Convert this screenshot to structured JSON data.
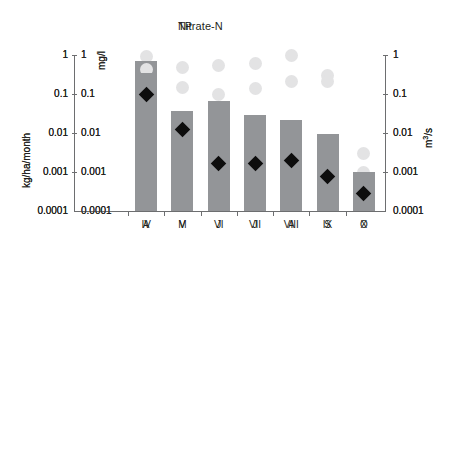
{
  "figure": {
    "background": "#ffffff",
    "bar_color": "#939598",
    "circle_color": "#e3e3e4",
    "diamond_color": "#0d0d0d",
    "axis_color": "#6d6e70",
    "text_color": "#231f20"
  },
  "chart_data": [
    {
      "type": "bar",
      "title": "Nitrate-N",
      "panel_id": "nitrate-n",
      "xlabel": "",
      "ylabel": "kg/ha/month",
      "ylabel_secondary": "mg/l",
      "ylabel_right": "m3/s",
      "ylabel_right_display": "m3/s",
      "categories": [
        "IV",
        "V",
        "VI",
        "VII",
        "VIII",
        "IX",
        "X"
      ],
      "yscale": "log",
      "ylim": [
        0.0001,
        1
      ],
      "ytick_labels": [
        "1",
        "0.1",
        "0.01",
        "0.001",
        "0.0001"
      ],
      "ytick_values": [
        1,
        0.1,
        0.01,
        0.001,
        0.0001
      ],
      "ytick_labels_secondary": [
        "1",
        "0.1",
        "0.01",
        "0.001",
        "0.0001"
      ],
      "ytick_labels_right": [
        "1",
        "0.1",
        "0.01",
        "0.001",
        "0.0001"
      ],
      "grid": false,
      "legend": "none",
      "series": [
        {
          "name": "kg/ha/month",
          "mark": "bar",
          "color": "#939598",
          "values": [
            0.7,
            0.037,
            0.065,
            0.029,
            0.022,
            0.0095,
            0.001
          ]
        },
        {
          "name": "mg/l",
          "mark": "circle",
          "color": "#e3e3e4",
          "values": [
            0.9,
            0.48,
            0.55,
            0.62,
            1.0,
            0.3,
            0.001
          ]
        },
        {
          "name": "m3/s",
          "mark": "diamond",
          "color": "#0d0d0d",
          "values": [
            0.1,
            0.008,
            0.0017,
            0.0017,
            0.002,
            0.00075,
            0.00028
          ]
        }
      ]
    },
    {
      "type": "bar",
      "title": "TP",
      "panel_id": "tp",
      "xlabel": "",
      "ylabel": "kg/ha/month",
      "ylabel_secondary": "mg/l",
      "ylabel_right": "m3/s",
      "ylabel_right_display": "m3/s",
      "categories": [
        "A",
        "M",
        "J",
        "J",
        "A",
        "S",
        "O"
      ],
      "yscale": "log",
      "ylim": [
        0.0001,
        1
      ],
      "ytick_labels": [
        "1",
        "0.1",
        "0.01",
        "0.001",
        "0.0001"
      ],
      "ytick_values": [
        1,
        0.1,
        0.01,
        0.001,
        0.0001
      ],
      "ytick_labels_secondary": [
        "1",
        "0.1",
        "0.01",
        "0.001",
        "0.0001"
      ],
      "ytick_labels_right": [
        "1",
        "0.1",
        "0.01",
        "0.001",
        "0.0001"
      ],
      "grid": false,
      "legend": "none",
      "series": [
        {
          "name": "kg/ha/month",
          "mark": "bar",
          "color": "#939598",
          "values": [
            0.35,
            0.029,
            0.058,
            0.0078,
            0.0094,
            0.0094,
            0.0009
          ]
        },
        {
          "name": "mg/l",
          "mark": "circle",
          "color": "#e3e3e4",
          "values": [
            0.42,
            0.15,
            0.095,
            0.14,
            0.21,
            0.21,
            0.003
          ]
        },
        {
          "name": "m3/s",
          "mark": "diamond",
          "color": "#0d0d0d",
          "values": [
            0.095,
            0.012,
            0.0017,
            0.0017,
            0.002,
            0.00075,
            0.00028
          ]
        }
      ]
    }
  ]
}
